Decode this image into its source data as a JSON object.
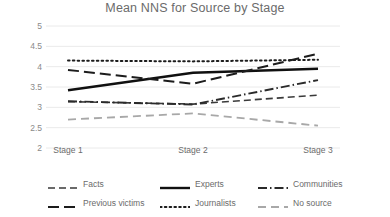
{
  "chart_data": {
    "type": "line",
    "title": "Mean NNS for Source by Stage",
    "xlabel": "",
    "ylabel": "",
    "categories": [
      "Stage 1",
      "Stage 2",
      "Stage 3"
    ],
    "ylim": [
      2,
      5
    ],
    "yticks": [
      5,
      4.5,
      4,
      3.5,
      3,
      2.5,
      2
    ],
    "ytick_labels": [
      "5",
      "4.5",
      "4",
      "3.5",
      "3",
      "2.5",
      "2"
    ],
    "grid": true,
    "grid_axis": "y",
    "legend_position": "bottom",
    "series": [
      {
        "name": "Facts",
        "values": [
          3.14,
          3.08,
          3.3
        ],
        "style": "dashed",
        "color": "#3a3a3a",
        "width": 1.6,
        "dasharray": "7,4"
      },
      {
        "name": "Experts",
        "values": [
          3.42,
          3.85,
          3.95
        ],
        "style": "solid",
        "color": "#101010",
        "width": 2.4,
        "dasharray": "none"
      },
      {
        "name": "Communities",
        "values": [
          3.15,
          3.07,
          3.67
        ],
        "style": "dash-dot",
        "color": "#2a2a2a",
        "width": 1.9,
        "dasharray": "9,3,1.5,3"
      },
      {
        "name": "Previous victims",
        "values": [
          3.92,
          3.58,
          4.32
        ],
        "style": "long-dashed",
        "color": "#1c1c1c",
        "width": 2.0,
        "dasharray": "11,5"
      },
      {
        "name": "Journalists",
        "values": [
          4.15,
          4.13,
          4.17
        ],
        "style": "dotted",
        "color": "#1c1c1c",
        "width": 2.0,
        "dasharray": "1.6,3.2"
      },
      {
        "name": "No source",
        "values": [
          2.7,
          2.85,
          2.55
        ],
        "style": "dashed-light",
        "color": "#a8a8a8",
        "width": 1.8,
        "dasharray": "8,5"
      }
    ],
    "colors": {
      "grid": "#eaeaea",
      "axis_text": "#8a8a8a",
      "title_text": "#6b6b6b",
      "background": "#ffffff"
    }
  },
  "legend": {
    "rows": [
      [
        {
          "label": "Facts",
          "series": 0
        },
        {
          "label": "Experts",
          "series": 1
        },
        {
          "label": "Communities",
          "series": 2
        }
      ],
      [
        {
          "label": "Previous victims",
          "series": 3
        },
        {
          "label": "Journalists",
          "series": 4
        },
        {
          "label": "No source",
          "series": 5
        }
      ]
    ]
  }
}
